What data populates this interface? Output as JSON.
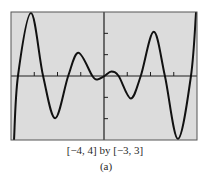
{
  "chart_data": {
    "type": "line",
    "title": "",
    "xlabel": "",
    "ylabel": "",
    "xlim": [
      -4,
      4
    ],
    "ylim": [
      -3,
      3
    ],
    "grid": false,
    "legend": null,
    "x_ticks": [
      -3,
      -2,
      -1,
      0,
      1,
      2,
      3
    ],
    "y_ticks": [
      -2,
      -1,
      0,
      1,
      2
    ],
    "tick_labels_shown": false,
    "series": [
      {
        "name": "f(x)",
        "x": [
          -3.87,
          -3.7,
          -3.14,
          -2.62,
          -2.1,
          -1.54,
          -1.1,
          -0.5,
          -0.28,
          0.02,
          0.32,
          0.63,
          1.15,
          1.58,
          2.14,
          2.62,
          3.18,
          3.74,
          3.96
        ],
        "y": [
          -3.0,
          0.0,
          2.95,
          0.0,
          -1.98,
          0.0,
          1.09,
          0.0,
          -0.16,
          0.0,
          0.21,
          0.0,
          -1.05,
          0.0,
          2.07,
          0.0,
          -2.95,
          0.0,
          3.0
        ]
      }
    ],
    "annotations": [
      "[-4, 4] by [-3, 3]",
      "(a)"
    ]
  },
  "figure": {
    "window_label": "[−4, 4] by [−3, 3]",
    "sub_label": "(a)",
    "colors": {
      "plot_background": "#dcdcdc",
      "frame": "#555555",
      "axes": "#1e1e1e",
      "curve": "#111111",
      "text": "#2a2a2a"
    }
  }
}
